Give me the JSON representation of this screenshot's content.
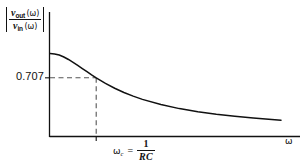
{
  "figure": {
    "background_color": "#ffffff",
    "ink_color": "#111111",
    "dash_color": "#555555"
  },
  "y_axis_label": {
    "abs_open": "|",
    "abs_close": "|",
    "numerator_var": "v",
    "numerator_sub": "out",
    "numerator_arg": "(ω)",
    "denominator_var": "v",
    "denominator_sub": "in",
    "denominator_arg": "(ω)"
  },
  "y_tick": {
    "label": "0.707",
    "value": 0.707
  },
  "x_tick": {
    "omega": "ω",
    "subscript": "c",
    "equals": "=",
    "numerator": "1",
    "denominator": "RC"
  },
  "x_axis_label": "ω",
  "chart_data": {
    "type": "line",
    "title": "",
    "subtitle": "",
    "xlabel": "ω",
    "ylabel": "|v_out(ω) / v_in(ω)|",
    "xlim": [
      0,
      5
    ],
    "ylim": [
      0,
      1.08
    ],
    "grid": false,
    "legend": null,
    "annotations": [
      {
        "text": "0.707",
        "type": "y-tick",
        "y": 0.707
      },
      {
        "text": "ωc = 1/RC",
        "type": "x-tick",
        "x": 1.0
      },
      {
        "text": "dashed guide lines from 0.707 to cutoff point",
        "type": "guide"
      }
    ],
    "series": [
      {
        "name": "|H(ω)| = 1/sqrt(1+(ωRC)^2)",
        "description": "First-order RC low-pass filter magnitude response",
        "x": [
          0.0,
          0.1,
          0.2,
          0.3,
          0.4,
          0.5,
          0.6,
          0.7,
          0.8,
          0.9,
          1.0,
          1.2,
          1.4,
          1.6,
          1.8,
          2.0,
          2.4,
          2.8,
          3.2,
          3.6,
          4.0,
          4.4,
          4.8,
          5.0
        ],
        "values": [
          1.0,
          0.995,
          0.981,
          0.958,
          0.928,
          0.894,
          0.857,
          0.819,
          0.781,
          0.743,
          0.707,
          0.64,
          0.581,
          0.53,
          0.486,
          0.447,
          0.385,
          0.336,
          0.298,
          0.268,
          0.243,
          0.222,
          0.204,
          0.196
        ]
      }
    ]
  }
}
